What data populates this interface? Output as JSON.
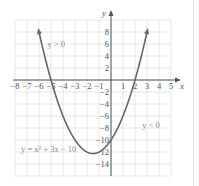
{
  "chart_data": {
    "type": "line",
    "title": "",
    "xlabel": "x",
    "ylabel": "y",
    "xlim": [
      -8,
      5
    ],
    "ylim": [
      -16,
      10
    ],
    "grid": true,
    "x_ticks": [
      -8,
      -7,
      -6,
      -5,
      -4,
      -3,
      -2,
      -1,
      1,
      2,
      3,
      4,
      5
    ],
    "x_tick_labels": [
      "−8",
      "−7",
      "−6",
      "−5",
      "−4",
      "−3",
      "−2",
      "−1",
      "1",
      "2",
      "3",
      "4",
      "5"
    ],
    "y_ticks": [
      8,
      6,
      4,
      2,
      -2,
      -4,
      -6,
      -8,
      -10,
      -12,
      -14
    ],
    "y_tick_labels": [
      "8",
      "6",
      "4",
      "2",
      "−2",
      "−4",
      "−6",
      "−8",
      "−10",
      "−12",
      "−14"
    ],
    "series": [
      {
        "name": "y = x^2 + 3x - 10",
        "function": {
          "a": 1,
          "b": 3,
          "c": -10
        },
        "x_range": [
          -6,
          3
        ],
        "color": "#666666",
        "arrows": true
      }
    ],
    "annotations": [
      {
        "id": "positive",
        "text": "y > 0",
        "x": -5.3,
        "y": 5.5
      },
      {
        "id": "negative",
        "text": "y < 0",
        "x": 2.6,
        "y": -8
      },
      {
        "id": "equation",
        "text": "y = x² + 3x − 10",
        "x": -7.5,
        "y": -12
      }
    ]
  },
  "colors": {
    "curve": "#666666",
    "axis": "#555555",
    "grid": "#dcdcdc"
  }
}
